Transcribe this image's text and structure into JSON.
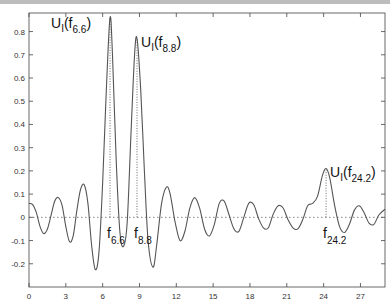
{
  "chart_data": {
    "type": "line",
    "title": "",
    "xlabel": "",
    "ylabel": "",
    "xlim": [
      0,
      29
    ],
    "ylim": [
      -0.3,
      0.88
    ],
    "grid": false,
    "legend": null,
    "x_ticks": [
      0,
      3,
      6,
      9,
      12,
      15,
      18,
      21,
      24,
      27
    ],
    "y_ticks": [
      -0.2,
      -0.1,
      0,
      0.1,
      0.2,
      0.3,
      0.4,
      0.5,
      0.6,
      0.7,
      0.8
    ],
    "y_tick_labels": [
      "-0.2",
      "-0.1",
      "0",
      "0.1",
      "0.2",
      "0.3",
      "0.4",
      "0.5",
      "0.6",
      "0.7",
      "0.8"
    ],
    "series": [
      {
        "name": "U_I(f)",
        "style": "solid",
        "points": [
          [
            0.0,
            0.06
          ],
          [
            0.3,
            0.055
          ],
          [
            0.6,
            0.02
          ],
          [
            0.9,
            -0.04
          ],
          [
            1.2,
            -0.07
          ],
          [
            1.5,
            -0.05
          ],
          [
            1.8,
            0.01
          ],
          [
            2.1,
            0.07
          ],
          [
            2.4,
            0.085
          ],
          [
            2.7,
            0.05
          ],
          [
            3.0,
            -0.04
          ],
          [
            3.3,
            -0.105
          ],
          [
            3.6,
            -0.08
          ],
          [
            3.9,
            0.03
          ],
          [
            4.2,
            0.12
          ],
          [
            4.5,
            0.14
          ],
          [
            4.8,
            0.06
          ],
          [
            5.1,
            -0.12
          ],
          [
            5.4,
            -0.225
          ],
          [
            5.7,
            -0.15
          ],
          [
            6.0,
            0.15
          ],
          [
            6.3,
            0.55
          ],
          [
            6.6,
            0.86
          ],
          [
            6.8,
            0.7
          ],
          [
            7.1,
            0.25
          ],
          [
            7.4,
            -0.06
          ],
          [
            7.7,
            -0.125
          ],
          [
            8.0,
            -0.02
          ],
          [
            8.3,
            0.35
          ],
          [
            8.6,
            0.7
          ],
          [
            8.8,
            0.77
          ],
          [
            9.1,
            0.55
          ],
          [
            9.4,
            0.2
          ],
          [
            9.7,
            -0.1
          ],
          [
            10.1,
            -0.215
          ],
          [
            10.4,
            -0.12
          ],
          [
            10.8,
            0.06
          ],
          [
            11.2,
            0.13
          ],
          [
            11.5,
            0.1
          ],
          [
            11.9,
            -0.02
          ],
          [
            12.3,
            -0.1
          ],
          [
            12.7,
            -0.06
          ],
          [
            13.1,
            0.04
          ],
          [
            13.5,
            0.085
          ],
          [
            13.9,
            0.04
          ],
          [
            14.3,
            -0.05
          ],
          [
            14.7,
            -0.08
          ],
          [
            15.1,
            -0.03
          ],
          [
            15.5,
            0.06
          ],
          [
            15.9,
            0.07
          ],
          [
            16.3,
            0.01
          ],
          [
            16.7,
            -0.05
          ],
          [
            17.1,
            -0.06
          ],
          [
            17.5,
            0.0
          ],
          [
            17.9,
            0.06
          ],
          [
            18.3,
            0.055
          ],
          [
            18.7,
            -0.005
          ],
          [
            19.1,
            -0.045
          ],
          [
            19.5,
            -0.045
          ],
          [
            19.9,
            0.015
          ],
          [
            20.3,
            0.05
          ],
          [
            20.7,
            0.04
          ],
          [
            21.1,
            -0.01
          ],
          [
            21.5,
            -0.045
          ],
          [
            21.9,
            -0.05
          ],
          [
            22.3,
            -0.01
          ],
          [
            22.7,
            0.05
          ],
          [
            23.1,
            0.06
          ],
          [
            23.5,
            0.09
          ],
          [
            23.9,
            0.18
          ],
          [
            24.2,
            0.21
          ],
          [
            24.5,
            0.17
          ],
          [
            24.9,
            0.05
          ],
          [
            25.3,
            -0.04
          ],
          [
            25.7,
            -0.065
          ],
          [
            26.1,
            -0.03
          ],
          [
            26.5,
            0.03
          ],
          [
            26.9,
            0.05
          ],
          [
            27.3,
            0.02
          ],
          [
            27.7,
            -0.025
          ],
          [
            28.1,
            -0.03
          ],
          [
            28.5,
            0.01
          ],
          [
            29.0,
            0.035
          ]
        ]
      }
    ],
    "reference_lines": [
      {
        "type": "horizontal",
        "y": 0,
        "style": "dotted"
      },
      {
        "type": "vertical",
        "x": 6.6,
        "y_from": 0,
        "y_to": 0.86,
        "style": "dotted"
      },
      {
        "type": "vertical",
        "x": 8.8,
        "y_from": 0,
        "y_to": 0.77,
        "style": "dotted"
      },
      {
        "type": "vertical",
        "x": 24.2,
        "y_from": 0,
        "y_to": 0.21,
        "style": "dotted"
      }
    ],
    "annotations": [
      {
        "text": "U_I(f_6.6)",
        "base": "U",
        "sub1": "I",
        "mid": "(f",
        "sub2": "6.6",
        "end": ")",
        "x": 6.6,
        "y": 0.86,
        "position": "top-left"
      },
      {
        "text": "U_I(f_8.8)",
        "base": "U",
        "sub1": "I",
        "mid": "(f",
        "sub2": "8.8",
        "end": ")",
        "x": 8.8,
        "y": 0.77,
        "position": "right"
      },
      {
        "text": "U_I(f_24.2)",
        "base": "U",
        "sub1": "I",
        "mid": "(f",
        "sub2": "24.2",
        "end": ")",
        "x": 24.2,
        "y": 0.21,
        "position": "right"
      },
      {
        "text": "f_6.6",
        "base": "f",
        "sub": "6.6",
        "x": 6.6,
        "y": 0,
        "position": "below"
      },
      {
        "text": "f_8.8",
        "base": "f",
        "sub": "8.8",
        "x": 8.8,
        "y": 0,
        "position": "below"
      },
      {
        "text": "f_24.2",
        "base": "f",
        "sub": "24.2",
        "x": 24.2,
        "y": 0,
        "position": "below"
      }
    ]
  },
  "colors": {
    "line": "#555555",
    "axis": "#444444",
    "dotted": "#666666",
    "text": "#111111"
  }
}
